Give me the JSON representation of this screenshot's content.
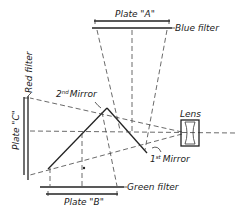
{
  "diagram": {
    "type": "three-color camera beam-splitter optics",
    "labels": {
      "plate_a": "Plate \"A\"",
      "blue_filter": "Blue filter",
      "red_filter": "Red filter",
      "plate_c": "Plate \"C\"",
      "second_mirror": "2nd Mirror",
      "second_mirror_base": "2",
      "second_mirror_sup": "nd",
      "second_mirror_word": "Mirror",
      "first_mirror": "1st Mirror",
      "first_mirror_base": "1",
      "first_mirror_sup": "st",
      "first_mirror_word": "Mirror",
      "lens": "Lens",
      "green_filter": "Green filter",
      "plate_b": "Plate \"B\""
    },
    "colors": {
      "line": "#222222",
      "background": "#ffffff"
    }
  }
}
